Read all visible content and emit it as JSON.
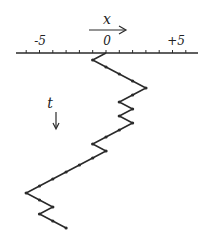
{
  "diagram": {
    "type": "random-walk",
    "x_axis": {
      "name": "x",
      "direction": "right",
      "range": [
        -6.7,
        6.8
      ],
      "tick_step": 1,
      "tick_labels": [
        {
          "value": -5,
          "text": "-5"
        },
        {
          "value": 0,
          "text": "0"
        },
        {
          "value": 5,
          "text": "+5"
        }
      ]
    },
    "t_axis": {
      "name": "t",
      "direction": "down"
    },
    "walk": {
      "start": 0,
      "steps": [
        -1,
        1,
        1,
        1,
        1,
        -1,
        -1,
        1,
        -1,
        1,
        -1,
        -1,
        -1,
        1,
        -1,
        -1,
        -1,
        -1,
        -1,
        -1,
        1,
        1,
        -1,
        1,
        1
      ],
      "positions_summary": [
        0,
        -1,
        3,
        1,
        2,
        1,
        2,
        -1,
        0,
        -6,
        -4,
        -5,
        -3
      ]
    },
    "colors": {
      "ink": "#2a2a2a",
      "background": "#ffffff"
    }
  }
}
